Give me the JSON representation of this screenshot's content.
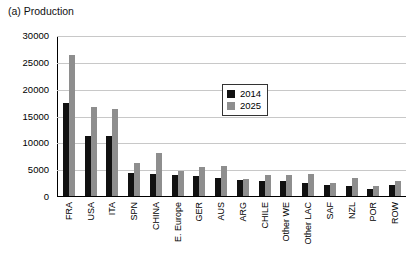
{
  "chart_data": {
    "type": "bar",
    "title": "(a) Production",
    "xlabel": "",
    "ylabel": "",
    "ylim": [
      0,
      30000
    ],
    "yticks": [
      0,
      5000,
      10000,
      15000,
      20000,
      25000,
      30000
    ],
    "grid": true,
    "legend_position": "upper-center-right",
    "categories": [
      "FRA",
      "USA",
      "ITA",
      "SPN",
      "CHINA",
      "E. Europe",
      "GER",
      "AUS",
      "ARG",
      "CHILE",
      "Other WE",
      "Other LAC",
      "SAF",
      "NZL",
      "POR",
      "ROW"
    ],
    "series": [
      {
        "name": "2014",
        "color": "#111111",
        "values": [
          17500,
          11200,
          11200,
          4400,
          4100,
          3850,
          3750,
          3400,
          3050,
          2900,
          2850,
          2500,
          2100,
          1800,
          1300,
          2000
        ]
      },
      {
        "name": "2025",
        "color": "#8e8e8e",
        "values": [
          26500,
          16600,
          16300,
          6200,
          8100,
          4650,
          5400,
          5700,
          3150,
          3950,
          3850,
          4100,
          2500,
          3350,
          1850,
          2850
        ]
      }
    ]
  },
  "legend": {
    "items": [
      {
        "label": "2014",
        "color": "#111111"
      },
      {
        "label": "2025",
        "color": "#8e8e8e"
      }
    ]
  }
}
